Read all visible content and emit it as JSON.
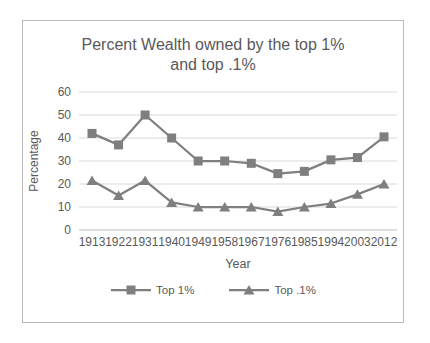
{
  "chart_data": {
    "type": "line",
    "title": "Percent Wealth owned by the top 1% and top .1%",
    "xlabel": "Year",
    "ylabel": "Percentage",
    "ylim": [
      0,
      60
    ],
    "yticks": [
      0,
      10,
      20,
      30,
      40,
      50,
      60
    ],
    "grid": true,
    "legend_position": "bottom",
    "categories": [
      "1913",
      "1922",
      "1931",
      "1940",
      "1949",
      "1958",
      "1967",
      "1976",
      "1985",
      "1994",
      "2003",
      "2012"
    ],
    "series": [
      {
        "name": "Top 1%",
        "marker": "square",
        "values": [
          42,
          37,
          50,
          40,
          30,
          30,
          29,
          24.5,
          25.5,
          30.5,
          31.5,
          40.5
        ]
      },
      {
        "name": "Top .1%",
        "marker": "triangle",
        "values": [
          21.5,
          15,
          21.5,
          12,
          10,
          10,
          10,
          8,
          10,
          11.5,
          15.5,
          20
        ]
      }
    ],
    "colors": {
      "series": "#7f7f7f",
      "gridline": "#d9d9d9",
      "axis_line": "#bfbfbf",
      "text": "#595959",
      "frame_border": "#b9b9b9"
    }
  }
}
